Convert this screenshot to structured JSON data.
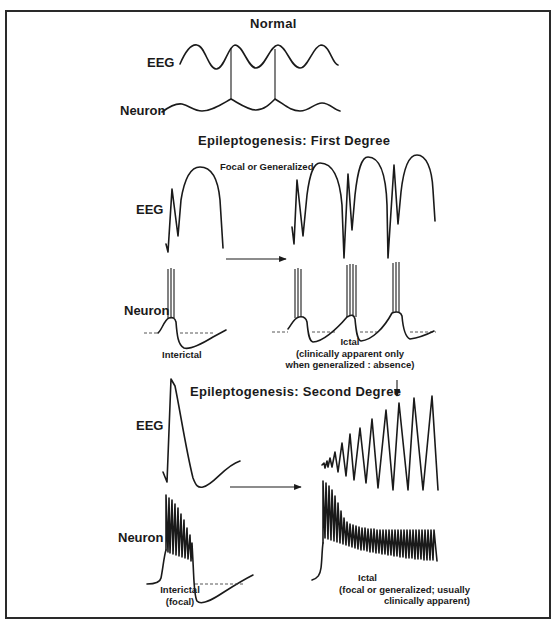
{
  "figure": {
    "sections": [
      {
        "title": "Normal",
        "labels": {
          "eeg": "EEG",
          "neuron": "Neuron"
        }
      },
      {
        "title": "Epileptogenesis: First Degree",
        "subtitle": "Focal or Generalized",
        "labels": {
          "eeg": "EEG",
          "neuron": "Neuron"
        },
        "interictal_caption": "Interictal",
        "ictal_caption": [
          "Ictal",
          "(clinically apparent only",
          "when generalized : absence)"
        ]
      },
      {
        "title": "Epileptogenesis: Second Degree",
        "labels": {
          "eeg": "EEG",
          "neuron": "Neuron"
        },
        "interictal_caption": [
          "Interictal",
          "(focal)"
        ],
        "ictal_caption": [
          "Ictal",
          "(focal or generalized; usually",
          "clinically apparent)"
        ]
      }
    ],
    "colors": {
      "ink": "#1a1a1a",
      "background": "#ffffff",
      "frame": "#2a2a2a"
    }
  }
}
